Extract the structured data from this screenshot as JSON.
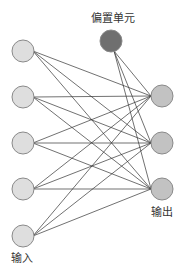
{
  "labels": {
    "bias": "偏置单元",
    "input": "输入",
    "output": "输出"
  },
  "colors": {
    "input_fill": "#dedede",
    "output_fill": "#c2c2c2",
    "bias_fill": "#6f6f6f",
    "stroke": "#8a8a8a",
    "edge": "#333333"
  },
  "nodes": {
    "inputs": [
      {
        "x": 23,
        "y": 51
      },
      {
        "x": 23,
        "y": 97
      },
      {
        "x": 23,
        "y": 143
      },
      {
        "x": 23,
        "y": 189
      },
      {
        "x": 23,
        "y": 236
      }
    ],
    "outputs": [
      {
        "x": 162,
        "y": 96
      },
      {
        "x": 162,
        "y": 143
      },
      {
        "x": 162,
        "y": 189
      }
    ],
    "bias": {
      "x": 111,
      "y": 41
    },
    "radius": 11
  }
}
